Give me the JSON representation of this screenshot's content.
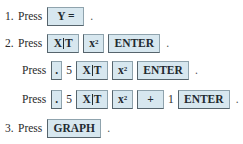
{
  "steps": [
    {
      "number": "1.",
      "verb": "Press",
      "keys": [
        {
          "label": "Y ="
        }
      ],
      "end": "."
    },
    {
      "number": "2.",
      "verb": "Press",
      "keys": [
        {
          "label_left": "X",
          "label_right": "T"
        },
        {
          "label": "x",
          "sup": "2"
        },
        {
          "label": "ENTER"
        }
      ],
      "end": "."
    },
    {
      "verb": "Press",
      "tokens": [
        {
          "type": "key",
          "label": "."
        },
        {
          "type": "text",
          "label": "5"
        },
        {
          "type": "key",
          "label_left": "X",
          "label_right": "T"
        },
        {
          "type": "key",
          "label": "x",
          "sup": "2"
        },
        {
          "type": "key",
          "label": "ENTER"
        }
      ],
      "end": "."
    },
    {
      "verb": "Press",
      "tokens": [
        {
          "type": "key",
          "label": "."
        },
        {
          "type": "text",
          "label": "5"
        },
        {
          "type": "key",
          "label_left": "X",
          "label_right": "T"
        },
        {
          "type": "key",
          "label": "x",
          "sup": "2"
        },
        {
          "type": "key",
          "label": "+"
        },
        {
          "type": "text",
          "label": "1"
        },
        {
          "type": "key",
          "label": "ENTER"
        }
      ],
      "end": "."
    },
    {
      "number": "3.",
      "verb": "Press",
      "keys": [
        {
          "label": "GRAPH"
        }
      ],
      "end": "."
    }
  ]
}
